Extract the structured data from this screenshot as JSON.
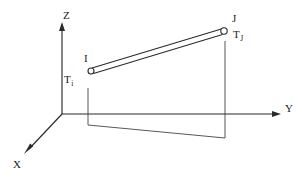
{
  "figure": {
    "background_color": "#ffffff",
    "line_color": "#2a2a2a",
    "width": 302,
    "height": 178
  },
  "axes": {
    "origin": {
      "x": 62,
      "y": 114
    },
    "z": {
      "name": "Z",
      "label": "Z",
      "direction": "up",
      "from": {
        "x": 62,
        "y": 114
      },
      "to": {
        "x": 62,
        "y": 25
      }
    },
    "y": {
      "name": "Y",
      "label": "Y",
      "direction": "right",
      "from": {
        "x": 62,
        "y": 114
      },
      "to": {
        "x": 281,
        "y": 114
      }
    },
    "x": {
      "name": "X",
      "label": "X",
      "direction": "down-left",
      "from": {
        "x": 62,
        "y": 114
      },
      "to": {
        "x": 24,
        "y": 154
      }
    }
  },
  "member": {
    "name": "beam-element",
    "start_node": "I",
    "end_node": "J",
    "start_point": {
      "x": 91,
      "y": 71
    },
    "end_point": {
      "x": 224,
      "y": 31
    },
    "offset_px": 3.0
  },
  "nodes": [
    {
      "id": "I",
      "label": "I",
      "temperature_label": "T",
      "temperature_subscript": "i",
      "center": {
        "x": 91,
        "y": 71
      },
      "radius": 3.0
    },
    {
      "id": "J",
      "label": "J",
      "temperature_label": "T",
      "temperature_subscript": "J",
      "center": {
        "x": 224,
        "y": 31
      },
      "radius": 3.2
    }
  ],
  "projection": {
    "name": "ground-projection-outline",
    "left_drop": {
      "x": 88,
      "y_top": 88,
      "y_bottom": 125
    },
    "right_drop": {
      "x": 225,
      "y_top": 41,
      "y_bottom": 138
    },
    "base_line": {
      "x1": 88,
      "y1": 125,
      "x2": 225,
      "y2": 138
    }
  }
}
